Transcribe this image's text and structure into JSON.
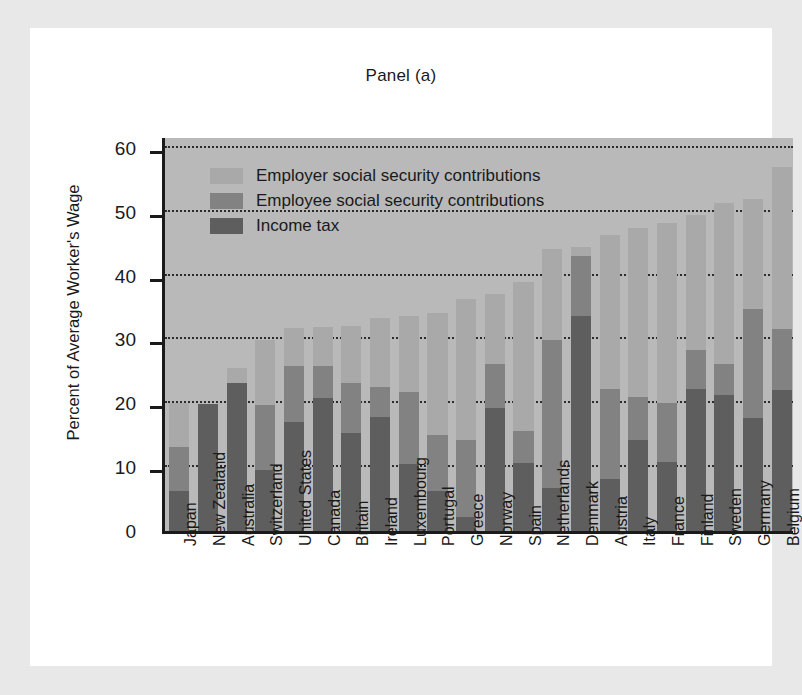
{
  "figure": {
    "title": "Panel (a)",
    "ylabel": "Percent of Average Worker's Wage"
  },
  "legend": {
    "position": "top-left-inside",
    "items": [
      {
        "label": "Employer social security contributions",
        "color": "#a9a9a9",
        "key": "employer"
      },
      {
        "label": "Employee social security contributions",
        "color": "#828282",
        "key": "employee"
      },
      {
        "label": "Income tax",
        "color": "#5e5e5e",
        "key": "income_tax"
      }
    ]
  },
  "axis": {
    "y_ticks": [
      0,
      10,
      20,
      30,
      40,
      50,
      60
    ],
    "y_tick_labels": [
      "0",
      "10",
      "20",
      "30",
      "40",
      "50",
      "60"
    ],
    "ylim": [
      0,
      62
    ],
    "grid": true
  },
  "chart_data": {
    "type": "bar",
    "stacked": true,
    "title": "Panel (a)",
    "xlabel": "",
    "ylabel": "Percent of Average Worker's Wage",
    "ylim": [
      0,
      62
    ],
    "grid": true,
    "legend_position": "top-left-inside",
    "categories": [
      "Japan",
      "New Zealand",
      "Australia",
      "Switzerland",
      "United States",
      "Canada",
      "Britain",
      "Ireland",
      "Luxembourg",
      "Portugal",
      "Greece",
      "Norway",
      "Spain",
      "Netherlands",
      "Denmark",
      "Austria",
      "Italy",
      "France",
      "Finland",
      "Sweden",
      "Germany",
      "Belgium"
    ],
    "series": [
      {
        "name": "Income tax",
        "color": "#5e5e5e",
        "values": [
          6.3,
          19.9,
          23.1,
          9.6,
          17.1,
          20.8,
          15.3,
          17.8,
          10.5,
          6.2,
          2.2,
          19.2,
          10.7,
          6.8,
          33.6,
          8.2,
          14.2,
          10.8,
          22.3,
          21.3,
          17.7,
          22.1
        ]
      },
      {
        "name": "Employee social security contributions",
        "color": "#828282",
        "values": [
          6.9,
          0.0,
          0.0,
          10.1,
          8.8,
          5.0,
          7.8,
          4.8,
          11.3,
          8.8,
          12.1,
          6.9,
          5.0,
          23.1,
          9.4,
          14.0,
          6.8,
          9.2,
          6.0,
          4.9,
          17.1,
          9.5
        ]
      },
      {
        "name": "Employer social security contributions",
        "color": "#a9a9a9",
        "values": [
          6.8,
          0.0,
          2.4,
          10.2,
          5.9,
          6.2,
          9.0,
          10.7,
          11.8,
          19.1,
          22.1,
          11.0,
          23.3,
          14.2,
          1.5,
          24.1,
          26.5,
          28.2,
          21.2,
          25.1,
          17.2,
          25.4
        ]
      }
    ],
    "totals": [
      20.0,
      19.9,
      25.5,
      29.9,
      31.8,
      32.0,
      32.1,
      33.3,
      33.6,
      34.1,
      36.4,
      37.1,
      39.0,
      44.1,
      44.5,
      46.3,
      47.5,
      48.2,
      49.5,
      51.3,
      52.0,
      57.0
    ]
  }
}
